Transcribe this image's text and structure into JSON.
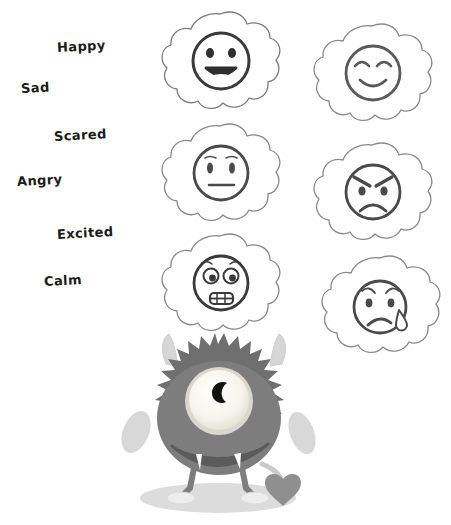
{
  "worksheet": {
    "title": "Feelings Faces Worksheet",
    "background_color": "#ffffff",
    "labels": [
      {
        "id": "happy",
        "text": "Happy",
        "x": 57,
        "y": 40
      },
      {
        "id": "sad",
        "text": "Sad",
        "x": 21,
        "y": 81
      },
      {
        "id": "scared",
        "text": "Scared",
        "x": 54,
        "y": 129
      },
      {
        "id": "angry",
        "text": "Angry",
        "x": 17,
        "y": 174
      },
      {
        "id": "excited",
        "text": "Excited",
        "x": 57,
        "y": 227
      },
      {
        "id": "calm",
        "text": "Calm",
        "x": 44,
        "y": 274
      }
    ],
    "label_color": "#1c1c1c"
  },
  "faces": [
    {
      "id": "face-open-smile",
      "expression": "happy-open-mouth",
      "description": "Round eyes with wide open smiling mouth",
      "outline_color": "#5a5a5a",
      "face_color": "#3a3a3a",
      "x": 158,
      "y": 8
    },
    {
      "id": "face-closed-eyes-smile",
      "expression": "content-smile",
      "description": "Curved closed happy eyes with gentle smile",
      "outline_color": "#8a8a8a",
      "face_color": "#5a5a5a",
      "x": 310,
      "y": 20
    },
    {
      "id": "face-neutral",
      "expression": "neutral",
      "description": "Oval eyes with raised brows and flat straight mouth",
      "outline_color": "#8a8a8a",
      "face_color": "#4a4a4a",
      "x": 158,
      "y": 120
    },
    {
      "id": "face-angry",
      "expression": "angry",
      "description": "Slanted angled eyebrows with deep frown",
      "outline_color": "#8a8a8a",
      "face_color": "#4a4a4a",
      "x": 310,
      "y": 139
    },
    {
      "id": "face-scared",
      "expression": "scared",
      "description": "Wide worried eyes with gritted teeth mouth",
      "outline_color": "#8a8a8a",
      "face_color": "#3a3a3a",
      "x": 158,
      "y": 230
    },
    {
      "id": "face-crying",
      "expression": "sad-crying",
      "description": "Worried brows, downturned mouth and a falling tear",
      "outline_color": "#8a8a8a",
      "face_color": "#4a4a4a",
      "x": 318,
      "y": 252
    }
  ],
  "monster": {
    "id": "furry-one-eyed-monster",
    "description": "Furry round one-eyed monster with horns, fangs, stubby arms, two feet and a heart-shaped tail",
    "body_color": "#7d7d7d",
    "fur_edge_color": "#6f6f6f",
    "horn_color": "#d6d6d6",
    "arm_color": "#d8d8d8",
    "eye_white_color": "#f4f2ea",
    "eye_ring_color": "#d9d7cf",
    "pupil_color": "#111111",
    "mouth_color": "#5b5b5b",
    "fang_color": "#fbfbf7",
    "foot_color": "#ededed",
    "heart_color": "#8f8f8f",
    "shadow_color": "#dcdcdc",
    "x": 110,
    "y": 328
  }
}
